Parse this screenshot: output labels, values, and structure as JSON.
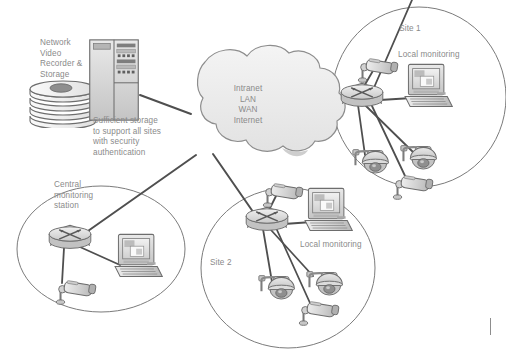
{
  "diagram": {
    "type": "network-topology",
    "background_color": "#ffffff",
    "text_color": "#8a8a8a",
    "line_color": "#595959",
    "cloud_fill": "#efefef",
    "device_fill": "#d9d9d9"
  },
  "nvr": {
    "label": "Network\nVideo\nRecorder &\nStorage",
    "caption": "Sufficient storage\nto support all sites\nwith security\nauthentication",
    "icon": "server-tower-icon",
    "storage_icon": "disk-stack-icon",
    "disk_count": 4
  },
  "cloud": {
    "label": "Intranet\nLAN\nWAN\nInternet",
    "lines": [
      "Intranet",
      "LAN",
      "WAN",
      "Internet"
    ],
    "icon": "cloud-icon"
  },
  "sites": [
    {
      "id": "site1",
      "label": "Site 1",
      "monitoring_label": "Local monitoring",
      "router_icon": "router-icon",
      "workstation_icon": "desktop-computer-icon",
      "cameras": [
        {
          "type": "bullet-camera-icon"
        },
        {
          "type": "dome-camera-icon"
        },
        {
          "type": "dome-camera-icon"
        },
        {
          "type": "bullet-camera-icon"
        }
      ]
    },
    {
      "id": "site2",
      "label": "Site 2",
      "monitoring_label": "Local monitoring",
      "router_icon": "router-icon",
      "workstation_icon": "desktop-computer-icon",
      "cameras": [
        {
          "type": "bullet-camera-icon"
        },
        {
          "type": "dome-camera-icon"
        },
        {
          "type": "dome-camera-icon"
        },
        {
          "type": "bullet-camera-icon"
        }
      ]
    },
    {
      "id": "central",
      "label": "Central\nmonitoring\nstation",
      "monitoring_label": "",
      "router_icon": "router-icon",
      "workstation_icon": "desktop-computer-icon",
      "cameras": [
        {
          "type": "bullet-camera-icon"
        }
      ]
    }
  ],
  "connections": [
    {
      "from": "nvr",
      "to": "cloud"
    },
    {
      "from": "cloud",
      "to": "site1-router"
    },
    {
      "from": "cloud",
      "to": "site2-router"
    },
    {
      "from": "cloud",
      "to": "central-router"
    }
  ]
}
